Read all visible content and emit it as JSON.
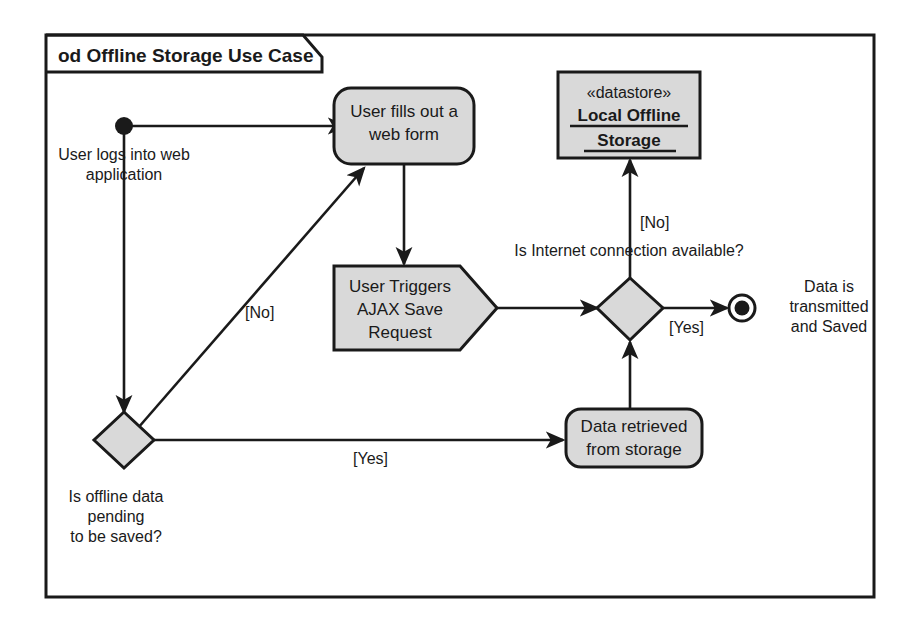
{
  "diagram": {
    "frame_label": "od Offline Storage Use Case",
    "type": "uml-activity-diagram",
    "colors": {
      "node_fill": "#d9d9d9",
      "stroke": "#1a1a1a",
      "background": "#ffffff"
    }
  },
  "nodes": {
    "initial": {
      "name": "initial-node",
      "label": ""
    },
    "login_note": {
      "line1": "User logs into web",
      "line2": "application"
    },
    "web_form": {
      "line1": "User fills out a",
      "line2": "web form"
    },
    "ajax": {
      "line1": "User Triggers",
      "line2": "AJAX Save",
      "line3": "Request"
    },
    "datastore": {
      "stereotype": "«datastore»",
      "line1": "Local Offline",
      "line2": "Storage"
    },
    "pending_decision": {
      "line1": "Is offline data",
      "line2": "pending",
      "line3": "to be saved?"
    },
    "internet_decision": {
      "label": "Is Internet connection available?"
    },
    "retrieved": {
      "line1": "Data retrieved",
      "line2": "from storage"
    },
    "final_note": {
      "line1": "Data is",
      "line2": "transmitted",
      "line3": "and Saved"
    }
  },
  "edges": {
    "pending_no": "[No]",
    "pending_yes": "[Yes]",
    "internet_no": "[No]",
    "internet_yes": "[Yes]"
  }
}
